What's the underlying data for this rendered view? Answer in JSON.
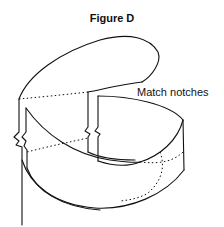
{
  "figure": {
    "title": "Figure D",
    "annotation": "Match notches",
    "line_color": "#111111",
    "background": "#ffffff"
  }
}
